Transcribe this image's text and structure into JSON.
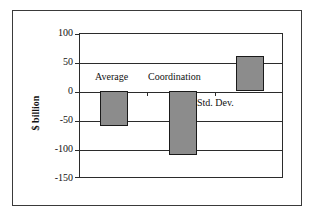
{
  "chart_data": {
    "type": "bar",
    "title": "",
    "subtitle": "",
    "xlabel": "",
    "ylabel": "$ billion",
    "categories": [
      "Average",
      "Coordination",
      "Std. Dev."
    ],
    "values": [
      -60,
      -112,
      62
    ],
    "ylim": [
      -150,
      100
    ],
    "ytick_labels": [
      "100",
      "50",
      "0",
      "-50",
      "-100",
      "-150"
    ],
    "ytick_values": [
      100,
      50,
      0,
      -50,
      -100,
      -150
    ],
    "grid": true,
    "legend": "none",
    "bar_fill_color": "#8c8c8c",
    "bar_edge_color": "#1a1a1a",
    "axis_color": "#2b2b2b",
    "frame_color": "#3a3a3a",
    "background_color": "#ffffff",
    "annotations": [
      {
        "text": "Average",
        "x": 0,
        "placement": "above-bar"
      },
      {
        "text": "Coordination",
        "x": 1,
        "placement": "above-bar"
      },
      {
        "text": "Std. Dev.",
        "x": 2,
        "placement": "below-bar"
      }
    ]
  },
  "axis": {
    "y_title": "$ billion",
    "ticks": [
      {
        "label": "100"
      },
      {
        "label": "50"
      },
      {
        "label": "0"
      },
      {
        "label": "-50"
      },
      {
        "label": "-100"
      },
      {
        "label": "-150"
      }
    ]
  },
  "labels": {
    "average": "Average",
    "coordination": "Coordination",
    "std_dev": "Std. Dev."
  }
}
